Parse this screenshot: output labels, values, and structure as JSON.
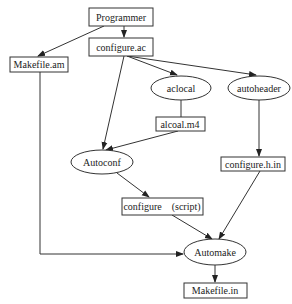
{
  "diagram": {
    "nodes": [
      {
        "id": "programmer",
        "label": "Programmer",
        "shape": "rect"
      },
      {
        "id": "configure_ac",
        "label": "configure.ac",
        "shape": "rect"
      },
      {
        "id": "makefile_am",
        "label": "Makefile.am",
        "shape": "rect"
      },
      {
        "id": "aclocal",
        "label": "aclocal",
        "shape": "ellipse"
      },
      {
        "id": "autoheader",
        "label": "autoheader",
        "shape": "ellipse"
      },
      {
        "id": "alcoal_m4",
        "label": "alcoal.m4",
        "shape": "rect"
      },
      {
        "id": "autoconf",
        "label": "Autoconf",
        "shape": "ellipse"
      },
      {
        "id": "configure_h_in",
        "label": "configure.h.in",
        "shape": "rect"
      },
      {
        "id": "configure_script",
        "label": "configure　(script)",
        "shape": "rect"
      },
      {
        "id": "automake",
        "label": "Automake",
        "shape": "ellipse"
      },
      {
        "id": "makefile_in",
        "label": "Makefile.in",
        "shape": "rect"
      }
    ],
    "edges": [
      {
        "from": "programmer",
        "to": "configure_ac"
      },
      {
        "from": "programmer",
        "to": "makefile_am"
      },
      {
        "from": "configure_ac",
        "to": "aclocal"
      },
      {
        "from": "configure_ac",
        "to": "autoheader"
      },
      {
        "from": "configure_ac",
        "to": "autoconf"
      },
      {
        "from": "aclocal",
        "to": "alcoal_m4"
      },
      {
        "from": "alcoal_m4",
        "to": "autoconf"
      },
      {
        "from": "autoheader",
        "to": "configure_h_in"
      },
      {
        "from": "autoconf",
        "to": "configure_script"
      },
      {
        "from": "configure_script",
        "to": "automake"
      },
      {
        "from": "configure_h_in",
        "to": "automake"
      },
      {
        "from": "makefile_am",
        "to": "automake"
      },
      {
        "from": "automake",
        "to": "makefile_in"
      }
    ]
  }
}
